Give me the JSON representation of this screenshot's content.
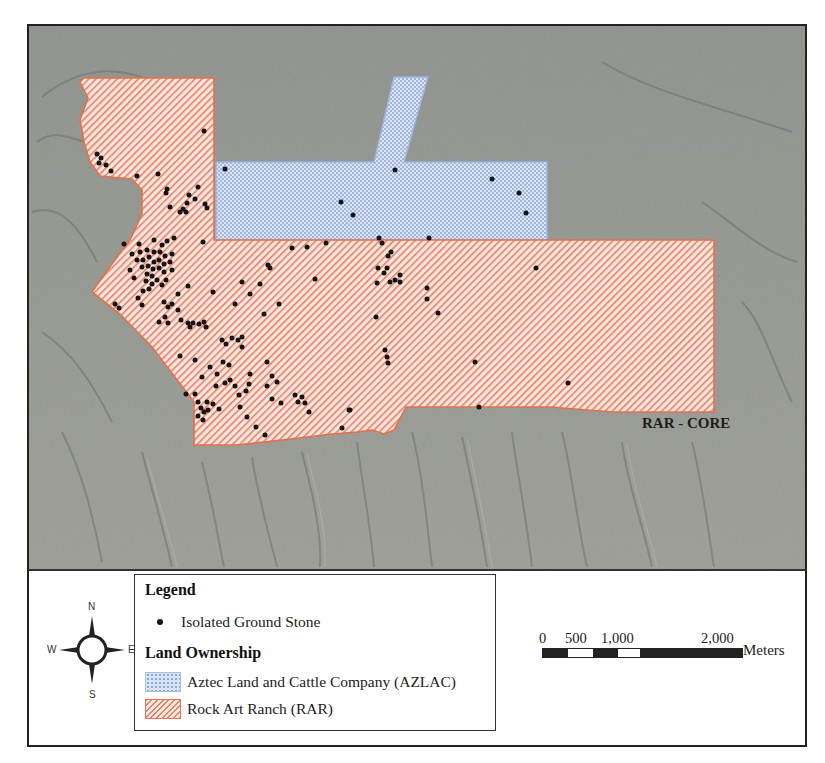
{
  "map": {
    "region_label": "RAR - CORE",
    "colors": {
      "terrain": "#8f918a",
      "rar_fill": "#fbe6dc",
      "rar_hatch": "#e6806b",
      "rar_outline": "#e4704f",
      "azlac_fill": "#d7e2f3",
      "azlac_dots": "#8ea8d5",
      "azlac_outline": "#9db4de",
      "point": "#151515"
    },
    "polygons": [
      {
        "name": "Rock Art Ranch (RAR)",
        "pattern": "diagonal-hatch"
      },
      {
        "name": "Aztec Land and Cattle Company (AZLAC)",
        "pattern": "cross-hatch"
      }
    ]
  },
  "legend": {
    "title": "Legend",
    "point_label": "Isolated Ground Stone",
    "section_title": "Land Ownership",
    "items": [
      {
        "label": "Aztec Land and Cattle Company (AZLAC)",
        "swatch": "azlac"
      },
      {
        "label": "Rock Art Ranch (RAR)",
        "swatch": "rar"
      }
    ]
  },
  "compass": {
    "n": "N",
    "s": "S",
    "e": "E",
    "w": "W"
  },
  "scale_bar": {
    "ticks": [
      "0",
      "500",
      "1,000",
      "2,000"
    ],
    "unit": "Meters"
  }
}
